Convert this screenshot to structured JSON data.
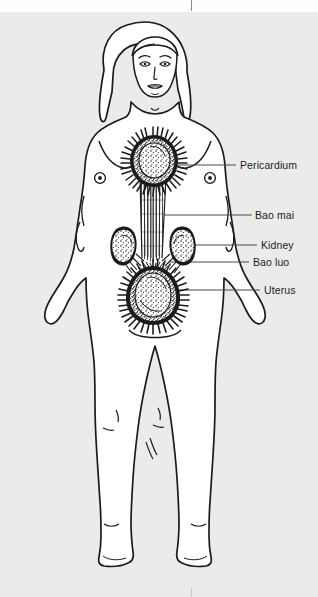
{
  "figure": {
    "kind": "anatomical-line-drawing",
    "background_color": "#ebebec",
    "body_fill": "#ffffff",
    "ink_color": "#1b1b1b",
    "crop_marks": {
      "top_tick": "|",
      "bottom_tick": "|"
    }
  },
  "labels": [
    {
      "id": "pericardium",
      "text": "Pericardium"
    },
    {
      "id": "bao_mai",
      "text": "Bao mai"
    },
    {
      "id": "kidney",
      "text": "Kidney"
    },
    {
      "id": "bao_luo",
      "text": "Bao luo"
    },
    {
      "id": "uterus",
      "text": "Uterus"
    }
  ],
  "organs": [
    {
      "id": "pericardium",
      "name": "Pericardium",
      "shape": "spiked-oval",
      "location": "upper-chest-center"
    },
    {
      "id": "bao_mai",
      "name": "Bao mai",
      "shape": "vertical-striated-channel",
      "location": "chest-to-abdomen-center"
    },
    {
      "id": "kidney_left",
      "name": "Kidney",
      "shape": "bean",
      "location": "mid-abdomen-left"
    },
    {
      "id": "kidney_right",
      "name": "Kidney",
      "shape": "bean",
      "location": "mid-abdomen-right"
    },
    {
      "id": "bao_luo",
      "name": "Bao luo",
      "shape": "hatched-strands",
      "location": "kidneys-to-uterus"
    },
    {
      "id": "uterus",
      "name": "Uterus",
      "shape": "spiked-pear",
      "location": "lower-abdomen-center"
    }
  ]
}
